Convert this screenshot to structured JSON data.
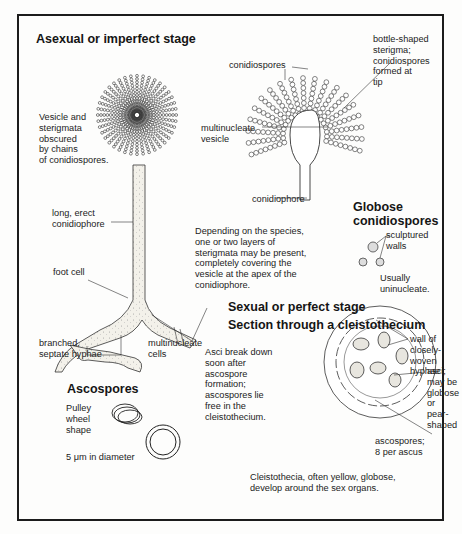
{
  "figure": {
    "sections": {
      "asexual": {
        "heading": "Asexual or imperfect stage",
        "labels": {
          "vesicle_obscured": "Vesicle and\nsterigmata\nobscured\nby chains\nof conidiospores.",
          "conidiospores": "conidiospores",
          "bottle_sterigma": "bottle-shaped\nsterigma;\nconidiospores\nformed at\ntip",
          "multinucleate_vesicle": "multinucleate\nvesicle",
          "conidiophore": "conidiophore",
          "long_erect": "long, erect\nconidiophore",
          "foot_cell": "foot cell",
          "branched_hyphae": "branched,\nseptate hyphae",
          "multinucleate_cells": "multinucleate\ncells",
          "depending": "Depending on the species,\none or two layers of\nsterigmata may be present,\ncompletely covering the\nvesicle at the apex of the\nconidiophore."
        }
      },
      "globose": {
        "heading": "Globose\nconidiospores",
        "labels": {
          "sculptured": "sculptured\nwalls",
          "uninucleate": "Usually\nuninucleate."
        }
      },
      "sexual": {
        "heading": "Sexual or perfect stage",
        "subheading": "Section through a cleistothecium",
        "labels": {
          "wall": "wall of closely-\nwoven hyphae",
          "asci": "asci; may be\nglobose or\npear-shaped",
          "asci_break": "Asci break down\nsoon after\nascospore\nformation;\nascospores lie\nfree in the\ncleistothecium.",
          "ascospores_count": "ascospores;\n8 per ascus",
          "cleistothecia_note": "Cleistothecia, often yellow, globose,\ndevelop around the sex organs."
        }
      },
      "ascospores": {
        "heading": "Ascospores",
        "labels": {
          "pulley": "Pulley\nwheel\nshape",
          "diameter": "5 μm in diameter"
        }
      }
    },
    "colors": {
      "ink": "#1a1a1a",
      "paper": "#fdfdfc",
      "stipple": "#f1efe8"
    }
  }
}
